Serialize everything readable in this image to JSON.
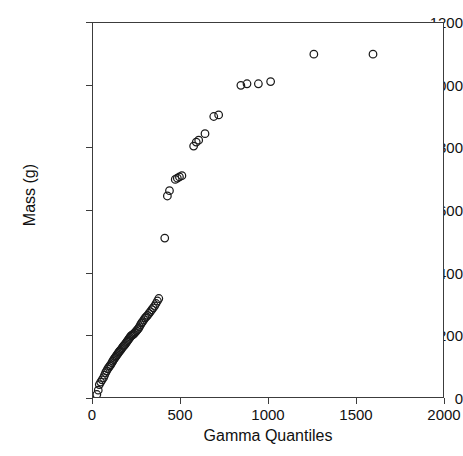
{
  "runhead": {
    "folio": "162",
    "title": "DATA MODELS AND STATISTICAL ANALYSIS"
  },
  "chart_data": {
    "type": "scatter",
    "title": "",
    "xlabel": "Gamma Quantiles",
    "ylabel": "Mass (g)",
    "xlim": [
      0,
      2000
    ],
    "ylim": [
      0,
      1200
    ],
    "xticks": [
      0,
      500,
      1000,
      1500,
      2000
    ],
    "yticks": [
      0,
      200,
      400,
      600,
      800,
      1000,
      1200
    ],
    "xticklabels": [
      "0",
      "500",
      "1000",
      "1500",
      "2000"
    ],
    "yticklabels": [
      "0",
      "200",
      "400",
      "600",
      "800",
      "1000",
      "1200"
    ],
    "grid": false,
    "legend": false,
    "marker": "open-circle",
    "marker_size": 5,
    "marker_color": "#1a1a1a",
    "series": [
      {
        "name": "Mass vs Gamma Quantiles",
        "points": [
          [
            22,
            8
          ],
          [
            30,
            22
          ],
          [
            36,
            40
          ],
          [
            44,
            48
          ],
          [
            52,
            55
          ],
          [
            60,
            62
          ],
          [
            66,
            70
          ],
          [
            72,
            78
          ],
          [
            78,
            84
          ],
          [
            84,
            90
          ],
          [
            90,
            95
          ],
          [
            96,
            100
          ],
          [
            102,
            104
          ],
          [
            108,
            110
          ],
          [
            113,
            115
          ],
          [
            118,
            120
          ],
          [
            123,
            124
          ],
          [
            128,
            128
          ],
          [
            133,
            132
          ],
          [
            138,
            136
          ],
          [
            143,
            140
          ],
          [
            148,
            144
          ],
          [
            152,
            147
          ],
          [
            157,
            150
          ],
          [
            162,
            154
          ],
          [
            167,
            158
          ],
          [
            172,
            162
          ],
          [
            177,
            165
          ],
          [
            182,
            168
          ],
          [
            187,
            172
          ],
          [
            192,
            176
          ],
          [
            197,
            180
          ],
          [
            202,
            184
          ],
          [
            207,
            188
          ],
          [
            212,
            192
          ],
          [
            217,
            196
          ],
          [
            222,
            198
          ],
          [
            227,
            200
          ],
          [
            232,
            202
          ],
          [
            237,
            205
          ],
          [
            242,
            208
          ],
          [
            248,
            212
          ],
          [
            254,
            216
          ],
          [
            260,
            220
          ],
          [
            266,
            226
          ],
          [
            272,
            232
          ],
          [
            278,
            238
          ],
          [
            284,
            242
          ],
          [
            291,
            248
          ],
          [
            298,
            254
          ],
          [
            305,
            258
          ],
          [
            312,
            262
          ],
          [
            320,
            268
          ],
          [
            328,
            274
          ],
          [
            336,
            280
          ],
          [
            344,
            286
          ],
          [
            352,
            292
          ],
          [
            360,
            300
          ],
          [
            368,
            308
          ],
          [
            376,
            316
          ],
          [
            410,
            510
          ],
          [
            425,
            645
          ],
          [
            437,
            662
          ],
          [
            470,
            698
          ],
          [
            482,
            702
          ],
          [
            494,
            706
          ],
          [
            508,
            710
          ],
          [
            575,
            805
          ],
          [
            590,
            818
          ],
          [
            604,
            824
          ],
          [
            640,
            845
          ],
          [
            690,
            900
          ],
          [
            718,
            905
          ],
          [
            845,
            1000
          ],
          [
            880,
            1005
          ],
          [
            945,
            1005
          ],
          [
            1015,
            1012
          ],
          [
            1262,
            1100
          ],
          [
            1600,
            1100
          ]
        ]
      }
    ]
  }
}
